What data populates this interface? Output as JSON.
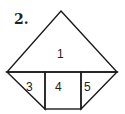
{
  "figure": {
    "number_label": "2.",
    "regions": [
      {
        "id": "1",
        "label": "1"
      },
      {
        "id": "3",
        "label": "3"
      },
      {
        "id": "4",
        "label": "4"
      },
      {
        "id": "5",
        "label": "5"
      }
    ],
    "stroke_color": "#1a1a1a",
    "fill_color": "#ffffff"
  }
}
